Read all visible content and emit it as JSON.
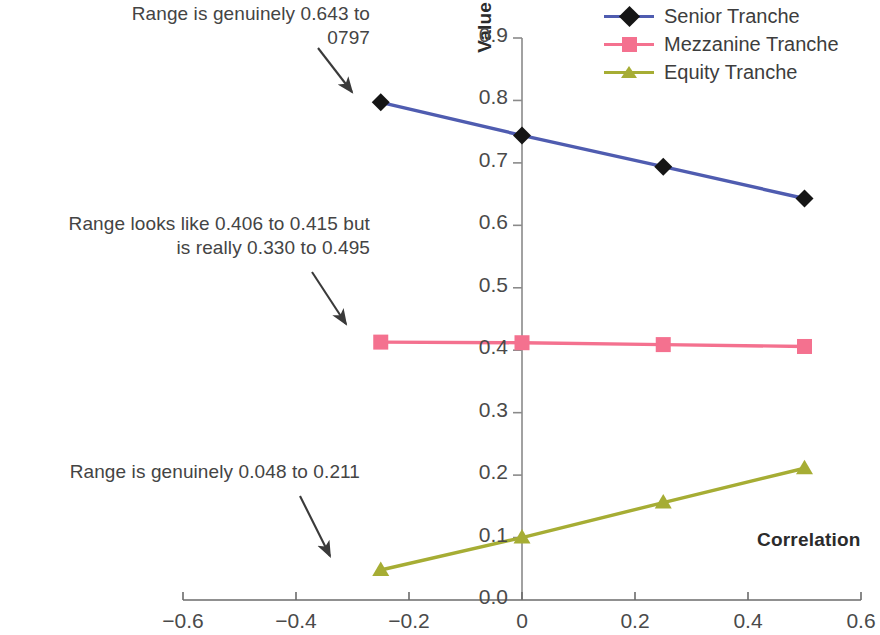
{
  "chart_data": {
    "type": "line",
    "title": "",
    "xlabel": "Correlation",
    "ylabel": "Value",
    "xlim": [
      -0.6,
      0.6
    ],
    "ylim": [
      0.0,
      0.9
    ],
    "xticks": [
      "-0.6",
      "-0.4",
      "-0.2",
      "0",
      "0.2",
      "0.4",
      "0.6"
    ],
    "xtick_values": [
      -0.6,
      -0.4,
      -0.2,
      0,
      0.2,
      0.4,
      0.6
    ],
    "yticks": [
      "0.0",
      "0.1",
      "0.2",
      "0.3",
      "0.4",
      "0.5",
      "0.6",
      "0.7",
      "0.8",
      "0.9"
    ],
    "ytick_values": [
      0.0,
      0.1,
      0.2,
      0.3,
      0.4,
      0.5,
      0.6,
      0.7,
      0.8,
      0.9
    ],
    "grid": false,
    "legend_position": "top-right",
    "x": [
      -0.25,
      0,
      0.25,
      0.5
    ],
    "series": [
      {
        "name": "Senior Tranche",
        "values": [
          0.797,
          0.744,
          0.694,
          0.643
        ],
        "color": "#4f5cb0",
        "marker": "diamond",
        "marker_color": "#151515"
      },
      {
        "name": "Mezzanine Tranche",
        "values": [
          0.413,
          0.412,
          0.409,
          0.406
        ],
        "color": "#f4718f",
        "marker": "square",
        "marker_color": "#f4718f"
      },
      {
        "name": "Equity Tranche",
        "values": [
          0.048,
          0.1,
          0.156,
          0.211
        ],
        "color": "#a6ad34",
        "marker": "triangle",
        "marker_color": "#a6ad34"
      }
    ],
    "annotations": [
      {
        "id": "senior",
        "text": "Range is genuinely 0.643 to 0797",
        "points_to_series": "Senior Tranche"
      },
      {
        "id": "mezzanine",
        "text": "Range looks like 0.406 to 0.415 but is really 0.330 to 0.495",
        "points_to_series": "Mezzanine Tranche"
      },
      {
        "id": "equity",
        "text": "Range is genuinely 0.048 to 0.211",
        "points_to_series": "Equity Tranche"
      }
    ]
  },
  "legend": {
    "items": [
      {
        "label": "Senior Tranche"
      },
      {
        "label": "Mezzanine Tranche"
      },
      {
        "label": "Equity Tranche"
      }
    ]
  },
  "axes": {
    "y_title": "Value",
    "x_title": "Correlation"
  },
  "annotations": {
    "senior": "Range is genuinely 0.643 to\n0797",
    "mezzanine": "Range looks like 0.406 to 0.415 but\nis really 0.330 to 0.495",
    "equity": "Range is genuinely 0.048 to 0.211"
  },
  "ticks": {
    "y": [
      "0.9",
      "0.8",
      "0.7",
      "0.6",
      "0.5",
      "0.4",
      "0.3",
      "0.2",
      "0.1",
      "0.0"
    ],
    "x": [
      "-0.6",
      "-0.4",
      "-0.2",
      "0",
      "0.2",
      "0.4",
      "0.6"
    ]
  }
}
